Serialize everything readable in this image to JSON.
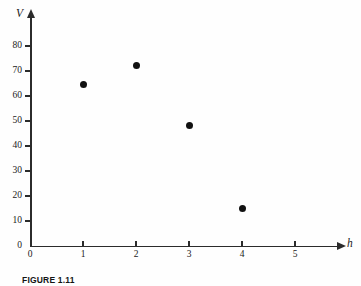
{
  "figure": {
    "caption": "FIGURE 1.11",
    "background_color": "#fefefe",
    "axis_color": "#2b2b2b",
    "marker_color": "#111111"
  },
  "chart_data": {
    "type": "scatter",
    "title": "",
    "subtitle": "",
    "xlabel": "h",
    "ylabel": "V",
    "xlim": [
      0,
      5.85
    ],
    "ylim": [
      0,
      92
    ],
    "grid": false,
    "legend": null,
    "x_ticks": [
      0,
      1,
      2,
      3,
      4,
      5
    ],
    "x_tick_labels": [
      "0",
      "1",
      "2",
      "3",
      "4",
      "5"
    ],
    "y_ticks": [
      0,
      10,
      20,
      30,
      40,
      50,
      60,
      70,
      80
    ],
    "y_tick_labels": [
      "0",
      "10",
      "20",
      "30",
      "40",
      "50",
      "60",
      "70",
      "80"
    ],
    "x": [
      1,
      2,
      3,
      4
    ],
    "values": [
      64.5,
      72.2,
      48.2,
      15.1
    ],
    "points": [
      {
        "x": 1,
        "y": 64.5
      },
      {
        "x": 2,
        "y": 72.2
      },
      {
        "x": 3,
        "y": 48.2
      },
      {
        "x": 4,
        "y": 15.1
      }
    ],
    "annotations": []
  }
}
